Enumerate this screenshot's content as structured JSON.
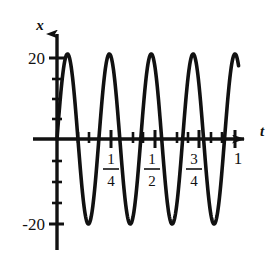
{
  "figure": {
    "background_color": "#ffffff",
    "ink_color": "#111111"
  },
  "axes": {
    "y_axis_label": "x",
    "x_axis_label": "t",
    "y_tick_top_label": "20",
    "y_tick_bottom_label": "-20",
    "x_tick_labels": [
      {
        "numerator": "1",
        "denominator": "4"
      },
      {
        "numerator": "1",
        "denominator": "2"
      },
      {
        "numerator": "3",
        "denominator": "4"
      }
    ],
    "x_tick_last_label": "1"
  },
  "chart_data": {
    "type": "line",
    "title": "",
    "xlabel": "t",
    "ylabel": "x",
    "xlim": [
      0,
      1.08
    ],
    "ylim": [
      -24,
      24
    ],
    "grid": false,
    "legend": null,
    "xticks": [
      0.25,
      0.5,
      0.75,
      1
    ],
    "xticklabels": [
      "1/4",
      "1/2",
      "3/4",
      "1"
    ],
    "yticks": [
      -20,
      20
    ],
    "yticklabels": [
      "-20",
      "20"
    ],
    "series": [
      {
        "name": "x(t)",
        "form": "sine",
        "amplitude": 21,
        "cycles_over_unit_t": 4.25,
        "phase": 0,
        "x": [
          0,
          0.01,
          0.02,
          0.03,
          0.04,
          0.05,
          0.06,
          0.07,
          0.08,
          0.09,
          0.1,
          0.11,
          0.12,
          0.13,
          0.14,
          0.15,
          0.16,
          0.17,
          0.18,
          0.19,
          0.2,
          0.21,
          0.22,
          0.23,
          0.24,
          0.25,
          0.26,
          0.27,
          0.28,
          0.29,
          0.3,
          0.31,
          0.32,
          0.33,
          0.34,
          0.35,
          0.36,
          0.37,
          0.38,
          0.39,
          0.4,
          0.41,
          0.42,
          0.43,
          0.44,
          0.45,
          0.46,
          0.47,
          0.48,
          0.49,
          0.5,
          0.51,
          0.52,
          0.53,
          0.54,
          0.55,
          0.56,
          0.57,
          0.58,
          0.59,
          0.6,
          0.61,
          0.62,
          0.63,
          0.64,
          0.65,
          0.66,
          0.67,
          0.68,
          0.69,
          0.7,
          0.71,
          0.72,
          0.73,
          0.74,
          0.75,
          0.76,
          0.77,
          0.78,
          0.79,
          0.8,
          0.81,
          0.82,
          0.83,
          0.84,
          0.85,
          0.86,
          0.87,
          0.88,
          0.89,
          0.9,
          0.91,
          0.92,
          0.93,
          0.94,
          0.95,
          0.96,
          0.97,
          0.98,
          0.99,
          1.0
        ],
        "y": [
          0.0,
          5.5,
          10.7,
          15.2,
          18.6,
          20.6,
          21.0,
          19.8,
          17.1,
          13.2,
          8.3,
          2.9,
          -2.7,
          -8.1,
          -13.1,
          -17.0,
          -19.8,
          -21.0,
          -20.6,
          -18.6,
          -15.2,
          -10.7,
          -5.5,
          0.0,
          5.5,
          10.7,
          15.2,
          18.6,
          20.6,
          21.0,
          19.8,
          17.1,
          13.2,
          8.3,
          2.9,
          -2.7,
          -8.1,
          -13.1,
          -17.0,
          -19.8,
          -21.0,
          -20.6,
          -18.6,
          -15.2,
          -10.7,
          -5.5,
          0.0,
          5.5,
          10.7,
          15.2,
          18.6,
          20.6,
          21.0,
          19.8,
          17.1,
          13.2,
          8.3,
          2.9,
          -2.7,
          -8.1,
          -13.1,
          -17.0,
          -19.8,
          -21.0,
          -20.6,
          -18.6,
          -15.2,
          -10.7,
          -5.5,
          0.0,
          5.5,
          10.7,
          15.2,
          18.6,
          20.6,
          21.0,
          19.8,
          17.1,
          13.2,
          8.3,
          2.9,
          -2.7,
          -8.1,
          -13.1,
          -17.0,
          -19.8,
          -21.0,
          -20.6,
          -18.6,
          -15.2,
          -10.7,
          -5.5,
          0.0,
          5.5,
          10.7,
          15.2,
          18.6,
          20.6,
          21.0,
          19.8,
          17.1
        ]
      }
    ],
    "annotations": [
      {
        "text": "x",
        "role": "y-axis-name"
      },
      {
        "text": "t",
        "role": "x-axis-name"
      }
    ]
  }
}
